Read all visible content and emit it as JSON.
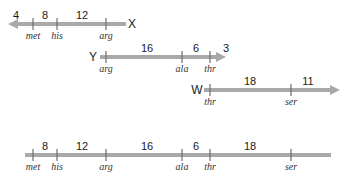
{
  "colors": {
    "line": "#a9a9a9",
    "tick": "#6e6e6e",
    "text": "#1a1a1a"
  },
  "fragments": [
    {
      "name": "X",
      "direction": "left",
      "y": 24,
      "line": [
        8,
        126
      ],
      "label_x": 132,
      "ticks": [
        {
          "x": 33,
          "residue": "met"
        },
        {
          "x": 57,
          "residue": "his"
        },
        {
          "x": 106,
          "residue": "arg"
        }
      ],
      "segments": [
        {
          "x": 16,
          "value": "4"
        },
        {
          "x": 45,
          "value": "8"
        },
        {
          "x": 82,
          "value": "12"
        }
      ]
    },
    {
      "name": "Y",
      "direction": "right",
      "y": 57,
      "line": [
        100,
        226
      ],
      "label_x": 93,
      "ticks": [
        {
          "x": 106,
          "residue": "arg"
        },
        {
          "x": 182,
          "residue": "ala"
        },
        {
          "x": 210,
          "residue": "thr"
        }
      ],
      "segments": [
        {
          "x": 147,
          "value": "16"
        },
        {
          "x": 196,
          "value": "6"
        },
        {
          "x": 226,
          "value": "3"
        }
      ]
    },
    {
      "name": "W",
      "direction": "right",
      "y": 90,
      "line": [
        204,
        340
      ],
      "label_x": 197,
      "ticks": [
        {
          "x": 210,
          "residue": "thr"
        },
        {
          "x": 291,
          "residue": "ser"
        }
      ],
      "segments": [
        {
          "x": 250,
          "value": "18"
        },
        {
          "x": 308,
          "value": "11"
        }
      ]
    }
  ],
  "combined": {
    "y": 155,
    "line": [
      25,
      331
    ],
    "ticks": [
      {
        "x": 33,
        "residue": "met"
      },
      {
        "x": 57,
        "residue": "his"
      },
      {
        "x": 106,
        "residue": "arg"
      },
      {
        "x": 182,
        "residue": "ala"
      },
      {
        "x": 210,
        "residue": "thr"
      },
      {
        "x": 291,
        "residue": "ser"
      }
    ],
    "segments": [
      {
        "x": 45,
        "value": "8"
      },
      {
        "x": 82,
        "value": "12"
      },
      {
        "x": 147,
        "value": "16"
      },
      {
        "x": 196,
        "value": "6"
      },
      {
        "x": 250,
        "value": "18"
      }
    ]
  }
}
